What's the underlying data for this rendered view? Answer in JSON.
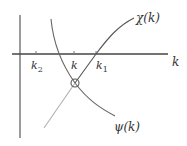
{
  "diagram": {
    "title": "",
    "axes": {
      "x_label": "k",
      "origin_x": 20,
      "axis_y": 54
    },
    "ticks": [
      {
        "id": "k2",
        "label_main": "k",
        "label_sub": "2",
        "x": 36
      },
      {
        "id": "k",
        "label_main": "k",
        "label_sub": "",
        "x": 74
      },
      {
        "id": "k1",
        "label_main": "k",
        "label_sub": "1",
        "x": 96
      }
    ],
    "curves": [
      {
        "id": "chi",
        "label": "χ(k)",
        "description": "increasing curve crossing the axis at k1"
      },
      {
        "id": "psi",
        "label": "ψ(k)",
        "description": "decreasing curve"
      }
    ],
    "intersection": {
      "label": "equilibrium point",
      "x": 75,
      "y": 83
    },
    "colors": {
      "axis": "#444444",
      "curve_chi_upper": "#555555",
      "curve_chi_lower": "#aaaaaa",
      "curve_psi": "#666666",
      "text": "#333333"
    }
  }
}
